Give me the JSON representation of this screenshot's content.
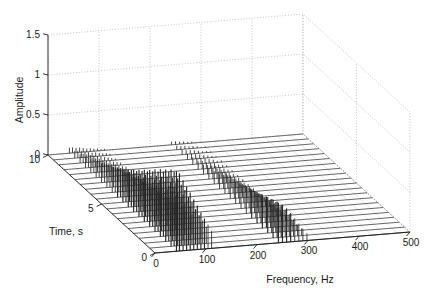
{
  "figure": {
    "kind": "3d-waterfall-spectrum",
    "background": "#ffffff",
    "line_color": "#1a1a1a",
    "grid_color": "#9a9a9a",
    "mesh_color": "#404040",
    "spike_color": "#262626"
  },
  "axes": {
    "x": {
      "label": "Frequency, Hz",
      "ticks": [
        "0",
        "100",
        "200",
        "300",
        "400",
        "500"
      ],
      "values": [
        0,
        100,
        200,
        300,
        400,
        500
      ],
      "min": 0,
      "max": 500
    },
    "y": {
      "label": "Time, s",
      "ticks": [
        "0",
        "5",
        "10"
      ],
      "values": [
        0,
        5,
        10
      ],
      "min": 0,
      "max": 10
    },
    "z": {
      "label": "Amplitude",
      "ticks": [
        "0",
        "0.5",
        "1",
        "1.5"
      ],
      "values": [
        0,
        0.5,
        1,
        1.5
      ],
      "min": 0,
      "max": 1.5
    }
  },
  "chart_data": {
    "type": "line",
    "title": "",
    "xlabel": "Frequency, Hz",
    "ylabel": "Time, s",
    "zlabel": "Amplitude",
    "xlim": [
      0,
      500
    ],
    "ylim": [
      0,
      10
    ],
    "zlim": [
      0,
      1.5
    ],
    "xticks": [
      0,
      100,
      200,
      300,
      400,
      500
    ],
    "yticks": [
      0,
      5,
      10
    ],
    "zticks": [
      0,
      0.5,
      1,
      1.5
    ],
    "grid": true,
    "legend": "none",
    "projection": "3d",
    "n_time_slices": 21,
    "time_slices": [
      0,
      0.5,
      1,
      1.5,
      2,
      2.5,
      3,
      3.5,
      4,
      4.5,
      5,
      5.5,
      6,
      6.5,
      7,
      7.5,
      8,
      8.5,
      9,
      9.5,
      10
    ],
    "note": "Waterfall of amplitude spectra over time; harmonic comb near 40-110 Hz decaying with time plus a second comb near 240-300 Hz",
    "peaks": [
      {
        "frequency": 42,
        "amplitudes": [
          1.0,
          0.96,
          0.9,
          0.84,
          0.78,
          0.71,
          0.65,
          0.59,
          0.53,
          0.47,
          0.42,
          0.37,
          0.32,
          0.28,
          0.24,
          0.2,
          0.17,
          0.14,
          0.11,
          0.09,
          0.07
        ]
      },
      {
        "frequency": 48,
        "amplitudes": [
          0.97,
          0.93,
          0.87,
          0.81,
          0.75,
          0.69,
          0.63,
          0.57,
          0.51,
          0.46,
          0.41,
          0.36,
          0.31,
          0.27,
          0.23,
          0.2,
          0.16,
          0.13,
          0.11,
          0.09,
          0.07
        ]
      },
      {
        "frequency": 55,
        "amplitudes": [
          0.88,
          0.84,
          0.79,
          0.74,
          0.68,
          0.63,
          0.57,
          0.52,
          0.47,
          0.42,
          0.37,
          0.33,
          0.29,
          0.25,
          0.21,
          0.18,
          0.15,
          0.12,
          0.1,
          0.08,
          0.06
        ]
      },
      {
        "frequency": 62,
        "amplitudes": [
          0.8,
          0.76,
          0.72,
          0.67,
          0.62,
          0.57,
          0.52,
          0.47,
          0.42,
          0.38,
          0.34,
          0.3,
          0.26,
          0.22,
          0.19,
          0.16,
          0.13,
          0.11,
          0.09,
          0.07,
          0.06
        ]
      },
      {
        "frequency": 69,
        "amplitudes": [
          0.72,
          0.69,
          0.65,
          0.6,
          0.56,
          0.51,
          0.47,
          0.42,
          0.38,
          0.34,
          0.3,
          0.27,
          0.23,
          0.2,
          0.17,
          0.14,
          0.12,
          0.1,
          0.08,
          0.06,
          0.05
        ]
      },
      {
        "frequency": 76,
        "amplitudes": [
          0.63,
          0.6,
          0.57,
          0.53,
          0.49,
          0.45,
          0.41,
          0.37,
          0.33,
          0.3,
          0.26,
          0.23,
          0.2,
          0.17,
          0.15,
          0.12,
          0.1,
          0.08,
          0.07,
          0.05,
          0.04
        ]
      },
      {
        "frequency": 83,
        "amplitudes": [
          0.55,
          0.53,
          0.5,
          0.46,
          0.43,
          0.39,
          0.36,
          0.32,
          0.29,
          0.26,
          0.23,
          0.2,
          0.17,
          0.15,
          0.13,
          0.11,
          0.09,
          0.07,
          0.06,
          0.05,
          0.04
        ]
      },
      {
        "frequency": 90,
        "amplitudes": [
          0.46,
          0.44,
          0.42,
          0.39,
          0.36,
          0.33,
          0.3,
          0.27,
          0.24,
          0.22,
          0.19,
          0.17,
          0.15,
          0.13,
          0.11,
          0.09,
          0.08,
          0.06,
          0.05,
          0.04,
          0.03
        ]
      },
      {
        "frequency": 97,
        "amplitudes": [
          0.38,
          0.36,
          0.34,
          0.32,
          0.3,
          0.27,
          0.25,
          0.22,
          0.2,
          0.18,
          0.16,
          0.14,
          0.12,
          0.1,
          0.09,
          0.08,
          0.06,
          0.05,
          0.04,
          0.03,
          0.03
        ]
      },
      {
        "frequency": 104,
        "amplitudes": [
          0.3,
          0.29,
          0.27,
          0.25,
          0.23,
          0.21,
          0.2,
          0.18,
          0.16,
          0.14,
          0.13,
          0.11,
          0.1,
          0.08,
          0.07,
          0.06,
          0.05,
          0.04,
          0.03,
          0.03,
          0.02
        ]
      },
      {
        "frequency": 111,
        "amplitudes": [
          0.22,
          0.21,
          0.2,
          0.18,
          0.17,
          0.16,
          0.14,
          0.13,
          0.12,
          0.1,
          0.09,
          0.08,
          0.07,
          0.06,
          0.05,
          0.04,
          0.04,
          0.03,
          0.02,
          0.02,
          0.02
        ]
      },
      {
        "frequency": 242,
        "amplitudes": [
          0.5,
          0.48,
          0.45,
          0.42,
          0.39,
          0.36,
          0.33,
          0.3,
          0.27,
          0.24,
          0.21,
          0.19,
          0.16,
          0.14,
          0.12,
          0.1,
          0.09,
          0.07,
          0.06,
          0.05,
          0.04
        ]
      },
      {
        "frequency": 250,
        "amplitudes": [
          0.47,
          0.45,
          0.42,
          0.39,
          0.36,
          0.33,
          0.31,
          0.28,
          0.25,
          0.22,
          0.2,
          0.17,
          0.15,
          0.13,
          0.11,
          0.1,
          0.08,
          0.07,
          0.05,
          0.04,
          0.04
        ]
      },
      {
        "frequency": 258,
        "amplitudes": [
          0.42,
          0.4,
          0.38,
          0.35,
          0.32,
          0.3,
          0.27,
          0.25,
          0.22,
          0.2,
          0.18,
          0.16,
          0.14,
          0.12,
          0.1,
          0.08,
          0.07,
          0.06,
          0.05,
          0.04,
          0.03
        ]
      },
      {
        "frequency": 266,
        "amplitudes": [
          0.36,
          0.34,
          0.32,
          0.3,
          0.28,
          0.25,
          0.23,
          0.21,
          0.19,
          0.17,
          0.15,
          0.13,
          0.12,
          0.1,
          0.09,
          0.07,
          0.06,
          0.05,
          0.04,
          0.03,
          0.03
        ]
      },
      {
        "frequency": 274,
        "amplitudes": [
          0.29,
          0.28,
          0.26,
          0.24,
          0.22,
          0.21,
          0.19,
          0.17,
          0.15,
          0.14,
          0.12,
          0.11,
          0.09,
          0.08,
          0.07,
          0.06,
          0.05,
          0.04,
          0.03,
          0.03,
          0.02
        ]
      },
      {
        "frequency": 282,
        "amplitudes": [
          0.22,
          0.21,
          0.2,
          0.18,
          0.17,
          0.15,
          0.14,
          0.13,
          0.11,
          0.1,
          0.09,
          0.08,
          0.07,
          0.06,
          0.05,
          0.04,
          0.04,
          0.03,
          0.02,
          0.02,
          0.02
        ]
      },
      {
        "frequency": 290,
        "amplitudes": [
          0.15,
          0.14,
          0.13,
          0.12,
          0.11,
          0.1,
          0.09,
          0.09,
          0.08,
          0.07,
          0.06,
          0.05,
          0.05,
          0.04,
          0.03,
          0.03,
          0.02,
          0.02,
          0.02,
          0.01,
          0.01
        ]
      },
      {
        "frequency": 298,
        "amplitudes": [
          0.09,
          0.09,
          0.08,
          0.08,
          0.07,
          0.06,
          0.06,
          0.05,
          0.05,
          0.04,
          0.04,
          0.03,
          0.03,
          0.02,
          0.02,
          0.02,
          0.02,
          0.01,
          0.01,
          0.01,
          0.01
        ]
      }
    ]
  }
}
